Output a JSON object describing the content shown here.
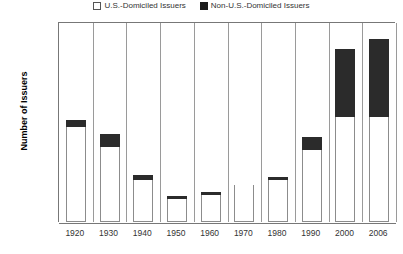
{
  "chart_data": {
    "type": "bar",
    "title": "",
    "xlabel": "",
    "ylabel": "Number of Issuers",
    "ylim": [
      0,
      6000
    ],
    "yticks": [
      "0",
      "1,000",
      "2,000",
      "3,000",
      "4,000",
      "5,000",
      "6,000"
    ],
    "ytick_values": [
      0,
      1000,
      2000,
      3000,
      4000,
      5000,
      6000
    ],
    "grid": false,
    "stacked": true,
    "legend_position": "top",
    "categories": [
      "1920",
      "1930",
      "1940",
      "1950",
      "1960",
      "1970",
      "1980",
      "1990",
      "2000",
      "2006"
    ],
    "series": [
      {
        "name": "U.S.-Domiciled Issuers",
        "color": "#ffffff",
        "values": [
          2850,
          2250,
          1250,
          700,
          800,
          1100,
          1250,
          2150,
          3150,
          3150
        ]
      },
      {
        "name": "Non-U.S.-Domiciled Issuers",
        "color": "#2b2b2b",
        "values": [
          200,
          400,
          150,
          50,
          100,
          0,
          30,
          400,
          2050,
          2350
        ]
      }
    ],
    "totals": [
      3050,
      2650,
      1400,
      750,
      900,
      1100,
      1280,
      2550,
      5200,
      5500
    ]
  },
  "legend": {
    "items": [
      {
        "label": "U.S.-Domiciled Issuers",
        "marker": "open-square-icon"
      },
      {
        "label": "Non-U.S.-Domiciled Issuers",
        "marker": "filled-square-icon"
      }
    ]
  }
}
